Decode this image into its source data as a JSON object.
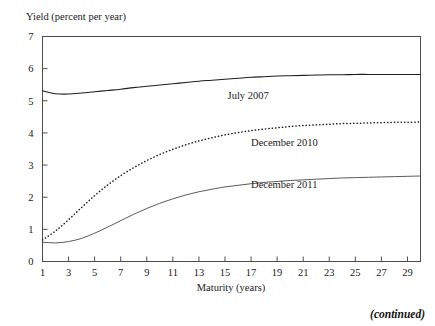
{
  "figure": {
    "y_axis_caption": "Yield (percent per year)",
    "x_axis_caption": "Maturity (years)",
    "continued_note": "(continued)"
  },
  "chart_data": {
    "type": "line",
    "title": "",
    "subtitle": "",
    "xlabel": "Maturity (years)",
    "ylabel": "Yield (percent per year)",
    "xlim": [
      1,
      30
    ],
    "ylim": [
      0,
      7
    ],
    "grid": false,
    "legend_position": "inline-annotations",
    "xticks": [
      1,
      3,
      5,
      7,
      9,
      11,
      13,
      15,
      17,
      19,
      21,
      23,
      25,
      27,
      29
    ],
    "xtick_labels": [
      "1",
      "3",
      "5",
      "7",
      "9",
      "11",
      "13",
      "15",
      "17",
      "19",
      "21",
      "23",
      "25",
      "27",
      "29"
    ],
    "yticks": [
      0,
      1,
      2,
      3,
      4,
      5,
      6,
      7
    ],
    "ytick_labels": [
      "0",
      "1",
      "2",
      "3",
      "4",
      "5",
      "6",
      "7"
    ],
    "x": [
      1,
      2,
      3,
      4,
      5,
      6,
      7,
      8,
      9,
      10,
      11,
      12,
      13,
      14,
      15,
      16,
      17,
      18,
      19,
      20,
      21,
      22,
      23,
      24,
      25,
      26,
      27,
      28,
      29,
      30
    ],
    "series": [
      {
        "name": "July 2007",
        "style": "solid",
        "label_x": 15.2,
        "label_y": 5.05,
        "values": [
          5.31,
          5.22,
          5.21,
          5.24,
          5.28,
          5.32,
          5.36,
          5.41,
          5.45,
          5.49,
          5.53,
          5.57,
          5.61,
          5.64,
          5.67,
          5.7,
          5.73,
          5.75,
          5.77,
          5.78,
          5.79,
          5.8,
          5.81,
          5.81,
          5.82,
          5.82,
          5.82,
          5.82,
          5.82,
          5.82
        ]
      },
      {
        "name": "December 2010",
        "style": "dotted",
        "label_x": 17.0,
        "label_y": 3.6,
        "values": [
          0.67,
          0.95,
          1.3,
          1.68,
          2.05,
          2.38,
          2.67,
          2.92,
          3.14,
          3.33,
          3.49,
          3.63,
          3.75,
          3.85,
          3.94,
          4.01,
          4.07,
          4.12,
          4.16,
          4.2,
          4.23,
          4.25,
          4.27,
          4.29,
          4.3,
          4.31,
          4.32,
          4.33,
          4.33,
          4.34
        ]
      },
      {
        "name": "December 2011",
        "style": "thin-solid",
        "label_x": 17.0,
        "label_y": 2.28,
        "values": [
          0.6,
          0.58,
          0.62,
          0.72,
          0.88,
          1.07,
          1.27,
          1.47,
          1.65,
          1.81,
          1.95,
          2.07,
          2.17,
          2.25,
          2.32,
          2.37,
          2.42,
          2.46,
          2.49,
          2.52,
          2.54,
          2.56,
          2.58,
          2.6,
          2.61,
          2.62,
          2.63,
          2.64,
          2.65,
          2.66
        ]
      }
    ]
  }
}
